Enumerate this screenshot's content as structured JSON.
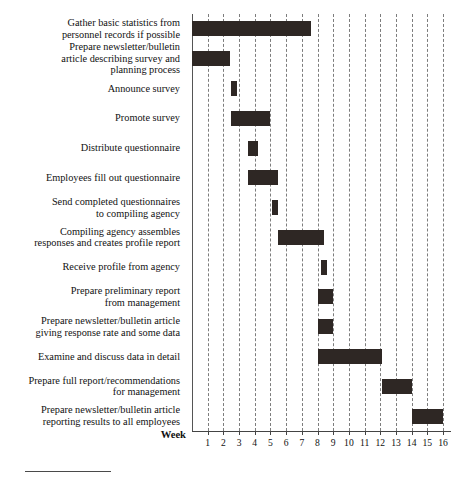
{
  "chart_data": {
    "type": "bar",
    "title": "",
    "xlabel": "Week",
    "ylabel": "",
    "orientation": "horizontal",
    "subtype": "gantt",
    "xlim": [
      0,
      16
    ],
    "grid": true,
    "grid_style": "dashed-vertical",
    "legend": null,
    "bar_color": "#2e2724",
    "axis_color": "#444444",
    "gridline_color": "#7d7d7d",
    "xticks": [
      1,
      2,
      3,
      4,
      5,
      6,
      7,
      8,
      9,
      10,
      11,
      12,
      13,
      14,
      15,
      16
    ],
    "xticklabels": [
      "1",
      "2",
      "3",
      "4",
      "5",
      "6",
      "7",
      "8",
      "9",
      "10",
      "11",
      "12",
      "13",
      "14",
      "15",
      "16"
    ],
    "categories": [
      "Gather basic statistics from personnel records if possible",
      "Prepare newsletter/bulletin article describing survey and planning process",
      "Announce survey",
      "Promote survey",
      "Distribute questionnaire",
      "Employees fill out questionnaire",
      "Send completed questionnaires to compiling agency",
      "Compiling agency assembles responses and creates profile report",
      "Receive profile from agency",
      "Prepare preliminary report from management",
      "Prepare newsletter/bulletin article giving response rate and some data",
      "Examine and discuss data in detail",
      "Prepare full report/recommendations for management",
      "Prepare newsletter/bulletin article reporting results to all employees"
    ],
    "tasks": [
      {
        "label_lines": [
          "Gather basic statistics from",
          "personnel records if possible"
        ],
        "start_week": 0.0,
        "end_week": 7.6,
        "duration_weeks": 7.6
      },
      {
        "label_lines": [
          "Prepare newsletter/bulletin",
          "article describing survey and",
          "planning process"
        ],
        "start_week": 0.0,
        "end_week": 2.4,
        "duration_weeks": 2.4
      },
      {
        "label_lines": [
          "Announce survey"
        ],
        "start_week": 2.5,
        "end_week": 2.9,
        "duration_weeks": 0.4
      },
      {
        "label_lines": [
          "Promote survey"
        ],
        "start_week": 2.5,
        "end_week": 5.0,
        "duration_weeks": 2.5
      },
      {
        "label_lines": [
          "Distribute questionnaire"
        ],
        "start_week": 3.6,
        "end_week": 4.2,
        "duration_weeks": 0.6
      },
      {
        "label_lines": [
          "Employees fill out questionnaire"
        ],
        "start_week": 3.6,
        "end_week": 5.5,
        "duration_weeks": 1.9
      },
      {
        "label_lines": [
          "Send completed questionnaires",
          "to compiling agency"
        ],
        "start_week": 5.1,
        "end_week": 5.5,
        "duration_weeks": 0.4
      },
      {
        "label_lines": [
          "Compiling agency assembles",
          "responses and creates profile report"
        ],
        "start_week": 5.5,
        "end_week": 8.4,
        "duration_weeks": 2.9
      },
      {
        "label_lines": [
          "Receive profile from agency"
        ],
        "start_week": 8.2,
        "end_week": 8.6,
        "duration_weeks": 0.4
      },
      {
        "label_lines": [
          "Prepare preliminary report",
          "from management"
        ],
        "start_week": 8.0,
        "end_week": 9.0,
        "duration_weeks": 1.0
      },
      {
        "label_lines": [
          "Prepare newsletter/bulletin article",
          "giving response rate and some data"
        ],
        "start_week": 8.0,
        "end_week": 9.0,
        "duration_weeks": 1.0
      },
      {
        "label_lines": [
          "Examine and discuss data in detail"
        ],
        "start_week": 8.0,
        "end_week": 12.1,
        "duration_weeks": 4.1
      },
      {
        "label_lines": [
          "Prepare full report/recommendations",
          "for management"
        ],
        "start_week": 12.1,
        "end_week": 14.0,
        "duration_weeks": 1.9
      },
      {
        "label_lines": [
          "Prepare newsletter/bulletin article",
          "reporting results to all employees"
        ],
        "start_week": 14.0,
        "end_week": 16.0,
        "duration_weeks": 2.0
      }
    ]
  },
  "axis": {
    "week_caption": "Week"
  }
}
